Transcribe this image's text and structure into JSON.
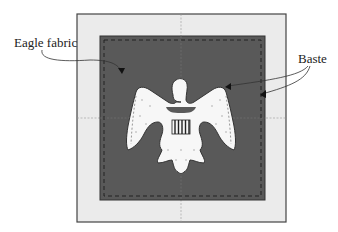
{
  "labels": {
    "eagle_fabric": "Eagle fabric",
    "baste": "Baste"
  },
  "colors": {
    "background_fabric": "#ebebeb",
    "eagle_fabric": "#595959",
    "appliqué": "#f7f7f7",
    "outline": "#333333"
  }
}
